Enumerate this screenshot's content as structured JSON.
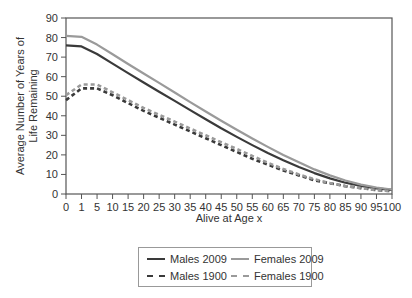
{
  "chart_data": {
    "type": "line",
    "title": "",
    "xlabel": "Alive at Age x",
    "ylabel": "Average Number of Years of Life Remaining",
    "ylim": [
      0,
      90
    ],
    "yticks": [
      0,
      10,
      20,
      30,
      40,
      50,
      60,
      70,
      80,
      90
    ],
    "categories": [
      "0",
      "1",
      "5",
      "10",
      "15",
      "20",
      "25",
      "30",
      "35",
      "40",
      "45",
      "50",
      "55",
      "60",
      "65",
      "70",
      "75",
      "80",
      "85",
      "90",
      "95",
      "100"
    ],
    "grid": false,
    "legend_position": "bottom",
    "series": [
      {
        "name": "Males 2009",
        "color": "#3a3a3a",
        "dash": "solid",
        "values": [
          76.0,
          75.5,
          71.6,
          66.7,
          61.8,
          57.0,
          52.3,
          47.6,
          42.9,
          38.2,
          33.6,
          29.2,
          25.0,
          21.0,
          17.3,
          13.8,
          10.7,
          8.0,
          5.8,
          4.1,
          2.9,
          2.1
        ]
      },
      {
        "name": "Females 2009",
        "color": "#9a9a9a",
        "dash": "solid",
        "values": [
          80.9,
          80.4,
          76.4,
          71.5,
          66.5,
          61.6,
          56.8,
          51.9,
          47.0,
          42.2,
          37.5,
          32.9,
          28.4,
          24.1,
          20.0,
          16.2,
          12.6,
          9.5,
          6.9,
          4.8,
          3.3,
          2.3
        ]
      },
      {
        "name": "Males 1900",
        "color": "#3a3a3a",
        "dash": "dashed",
        "values": [
          48.0,
          54.0,
          54.0,
          50.5,
          46.5,
          42.5,
          39.0,
          35.5,
          32.0,
          28.5,
          25.0,
          21.5,
          18.0,
          15.0,
          12.0,
          9.5,
          7.0,
          5.5,
          4.0,
          3.0,
          2.0,
          1.5
        ]
      },
      {
        "name": "Females 1900",
        "color": "#9a9a9a",
        "dash": "dashed",
        "values": [
          50.5,
          56.0,
          56.0,
          52.0,
          48.0,
          44.0,
          40.5,
          37.0,
          33.5,
          30.0,
          26.5,
          23.0,
          19.5,
          16.0,
          12.8,
          10.0,
          7.5,
          5.6,
          4.1,
          3.0,
          2.0,
          1.5
        ]
      }
    ]
  },
  "legend": {
    "items": [
      {
        "label": "Males 2009"
      },
      {
        "label": "Females 2009"
      },
      {
        "label": "Males 1900"
      },
      {
        "label": "Females 1900"
      }
    ]
  }
}
